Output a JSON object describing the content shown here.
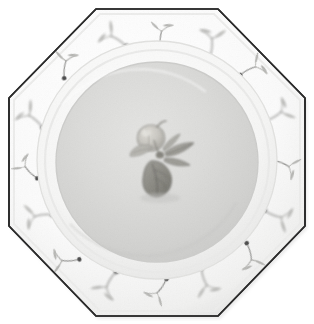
{
  "image": {
    "subject": "octagonal ceramic dinner plate",
    "view": "top-down flat lay, centered on plain white background",
    "canvas": {
      "width": 314,
      "height": 324,
      "background": "#ffffff"
    },
    "caption": "Octagonal white ceramic plate with painted fruit-sprig rim border and a central peach-and-leaves motif"
  },
  "plate": {
    "name": "octagonal-plate",
    "shape": "octagon",
    "rim_outline_color": "#2b2b2b",
    "rim_outline_width": 1.6,
    "rim_fill_color": "#fbfbfb",
    "rim_shadow_color": "#e6e6e6",
    "well_fill_color": "#dadad8",
    "well_edge_color": "#cfcfcd",
    "verge_highlight_color": "#f4f4f2",
    "center": {
      "x": 157,
      "y": 162
    },
    "outer_radius_flat": 154,
    "verge_radius": 118,
    "well_radius": 100,
    "octagon_vertices": [
      {
        "x": 96,
        "y": 9
      },
      {
        "x": 218,
        "y": 9
      },
      {
        "x": 305,
        "y": 98
      },
      {
        "x": 305,
        "y": 226
      },
      {
        "x": 218,
        "y": 316
      },
      {
        "x": 96,
        "y": 316
      },
      {
        "x": 9,
        "y": 226
      },
      {
        "x": 9,
        "y": 98
      }
    ]
  },
  "rim_decoration": {
    "name": "fruit-sprig-border",
    "motif": "sprig",
    "description": "repeating hand-painted sprig: slender curved stem ending in a dark round berry, paired with a small V of pointed leaves",
    "berry_color": "#4a4a4a",
    "stem_color": "#9a9a98",
    "leaf_color": "#b4b4b2",
    "count": 16,
    "sprigs": [
      {
        "angle": 250,
        "radius": 134,
        "rot": -42,
        "scale": 1.0,
        "flip": 1
      },
      {
        "angle": 272,
        "radius": 131,
        "rot": -10,
        "scale": 0.92,
        "flip": -1
      },
      {
        "angle": 294,
        "radius": 135,
        "rot": 20,
        "scale": 1.04,
        "flip": 1
      },
      {
        "angle": 316,
        "radius": 137,
        "rot": 48,
        "scale": 0.95,
        "flip": -1
      },
      {
        "angle": 338,
        "radius": 134,
        "rot": 74,
        "scale": 1.0,
        "flip": 1
      },
      {
        "angle": 2,
        "radius": 132,
        "rot": 98,
        "scale": 0.94,
        "flip": -1
      },
      {
        "angle": 24,
        "radius": 136,
        "rot": 126,
        "scale": 1.02,
        "flip": 1
      },
      {
        "angle": 46,
        "radius": 136,
        "rot": 150,
        "scale": 0.96,
        "flip": -1
      },
      {
        "angle": 68,
        "radius": 133,
        "rot": 176,
        "scale": 1.0,
        "flip": 1
      },
      {
        "angle": 90,
        "radius": 131,
        "rot": 200,
        "scale": 0.93,
        "flip": -1
      },
      {
        "angle": 112,
        "radius": 135,
        "rot": 226,
        "scale": 1.03,
        "flip": 1
      },
      {
        "angle": 134,
        "radius": 137,
        "rot": 252,
        "scale": 0.97,
        "flip": -1
      },
      {
        "angle": 156,
        "radius": 134,
        "rot": 278,
        "scale": 1.0,
        "flip": 1
      },
      {
        "angle": 178,
        "radius": 132,
        "rot": 300,
        "scale": 0.92,
        "flip": -1
      },
      {
        "angle": 200,
        "radius": 136,
        "rot": 326,
        "scale": 1.02,
        "flip": 1
      },
      {
        "angle": 228,
        "radius": 136,
        "rot": 352,
        "scale": 0.96,
        "flip": -1
      }
    ]
  },
  "center_motif": {
    "name": "peach-and-leaves-motif",
    "description": "single round stone fruit (peach) at upper left with a cluster of long pointed leaves fanning to the right and one broad leaf hanging below",
    "position": {
      "x": 157,
      "y": 155
    },
    "fruit_color": "#c8c6c0",
    "fruit_outline_color": "#9b9a95",
    "leaf_dark_color": "#8e8d87",
    "leaf_mid_color": "#a9a8a2",
    "leaf_light_color": "#c2c1bb",
    "stem_color": "#7f7e79"
  },
  "palette": {
    "background": "#ffffff",
    "plate_white": "#fbfbfb",
    "well_gray": "#dadad8",
    "outline_dark": "#2b2b2b",
    "motif_gray": "#9a9a95",
    "berry_dark": "#4a4a4a"
  }
}
